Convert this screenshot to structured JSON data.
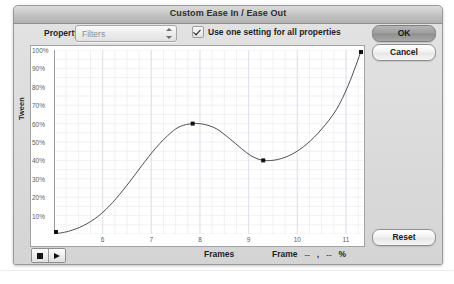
{
  "window": {
    "title": "Custom Ease In / Ease Out"
  },
  "controls": {
    "property_label": "Property:",
    "property_value": "Filters",
    "property_icon": "updown-arrows-icon",
    "checkbox_label": "Use one setting for all properties",
    "checkbox_checked": true
  },
  "buttons": {
    "ok": "OK",
    "cancel": "Cancel",
    "reset": "Reset"
  },
  "transport": {
    "stop_icon": "stop-icon",
    "play_icon": "play-icon"
  },
  "readout": {
    "frame_label": "Frame",
    "frame_value": "--",
    "comma": ",",
    "percent_value": "--",
    "percent_symbol": "%"
  },
  "chart_data": {
    "type": "line",
    "title": "",
    "xlabel": "Frames",
    "ylabel": "Tween",
    "xlim": [
      5,
      11.35
    ],
    "ylim": [
      0,
      100
    ],
    "xticks": [
      "6",
      "7",
      "8",
      "9",
      "10",
      "11"
    ],
    "xtick_values": [
      6,
      7,
      8,
      9,
      10,
      11
    ],
    "yticks": [
      "100%",
      "90%",
      "80%",
      "70%",
      "60%",
      "50%",
      "40%",
      "30%",
      "20%",
      "10%"
    ],
    "ytick_values": [
      100,
      90,
      80,
      70,
      60,
      50,
      40,
      30,
      20,
      10
    ],
    "grid": true,
    "legend": "none",
    "line_color": "#3c3c3c",
    "point_color": "#111111",
    "grid_color": "#e8e8ee",
    "series": [
      {
        "name": "ease-curve",
        "control_points": [
          {
            "x": 5.0,
            "y": 0
          },
          {
            "x": 7.85,
            "y": 60
          },
          {
            "x": 9.3,
            "y": 40
          },
          {
            "x": 11.32,
            "y": 100
          }
        ],
        "x": [
          5.0,
          5.3,
          5.6,
          5.9,
          6.2,
          6.5,
          6.8,
          7.1,
          7.4,
          7.6,
          7.85,
          8.1,
          8.35,
          8.6,
          8.85,
          9.05,
          9.3,
          9.6,
          9.9,
          10.2,
          10.5,
          10.8,
          11.05,
          11.32
        ],
        "y": [
          0,
          1.5,
          4.5,
          9.5,
          17,
          26.5,
          37,
          47,
          55,
          58.5,
          60,
          59.5,
          57,
          52,
          46.5,
          42.5,
          40,
          40.5,
          43.5,
          49,
          57,
          67.5,
          81,
          100
        ]
      }
    ]
  },
  "caption": {
    "text": ""
  }
}
